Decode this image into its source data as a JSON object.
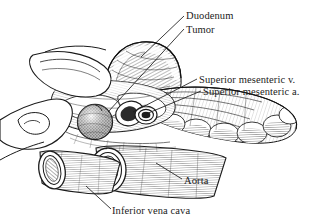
{
  "figure": {
    "kind": "anatomical-line-illustration",
    "style": "black-and-white pen-and-ink hatching",
    "background_color": "#ffffff",
    "ink_color": "#1b1b1b"
  },
  "labels": {
    "duodenum": "Duodenum",
    "tumor": "Tumor",
    "superior_mesenteric_vein": "Superior mesenteric v.",
    "superior_mesenteric_artery": "Superior mesenteric a.",
    "aorta": "Aorta",
    "inferior_vena_cava": "Inferior vena cava"
  },
  "structures": [
    {
      "name": "surgeon-hand",
      "description": "retracting hand outline, left side"
    },
    {
      "name": "duodenum",
      "description": "arching hatched loop, top center"
    },
    {
      "name": "tumor",
      "description": "round stippled mass, center left"
    },
    {
      "name": "superior-mesenteric-vein",
      "description": "vessel cross-section, center"
    },
    {
      "name": "superior-mesenteric-artery",
      "description": "ringed vessel cross-section, center right"
    },
    {
      "name": "small-bowel-mesentery",
      "description": "lobular mass extending right"
    },
    {
      "name": "aorta",
      "description": "large round vessel stump, bottom center"
    },
    {
      "name": "inferior-vena-cava",
      "description": "flattened oval vessel stump, bottom left"
    }
  ]
}
